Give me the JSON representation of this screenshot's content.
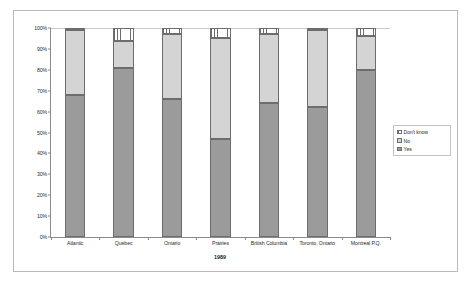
{
  "chart_data": {
    "type": "bar",
    "subtype": "stacked-100-percent",
    "title": "",
    "xlabel": "1989",
    "ylabel": "",
    "ylim": [
      0,
      100
    ],
    "y_ticks": [
      "0%",
      "10%",
      "20%",
      "30%",
      "40%",
      "50%",
      "60%",
      "70%",
      "80%",
      "90%",
      "100%"
    ],
    "y_tick_values": [
      0,
      10,
      20,
      30,
      40,
      50,
      60,
      70,
      80,
      90,
      100
    ],
    "grid": false,
    "legend_position": "right",
    "categories": [
      "Atlantic",
      "Quebec",
      "Ontario",
      "Prairies",
      "British Columbia",
      "Toronto, Ontario",
      "Montreal P.Q."
    ],
    "series": [
      {
        "name": "Yes",
        "values": [
          68,
          81,
          66,
          47,
          64,
          62,
          80
        ],
        "color": "#9b9b9b",
        "fill": "solid"
      },
      {
        "name": "No",
        "values": [
          31,
          13,
          31,
          48,
          33,
          37,
          16
        ],
        "color": "#d4d4d4",
        "fill": "solid"
      },
      {
        "name": "Don't know",
        "values": [
          1,
          6,
          3,
          5,
          3,
          1,
          4
        ],
        "color": "#ffffff",
        "fill": "crosshatch"
      }
    ],
    "legend": [
      "Don't know",
      "No",
      "Yes"
    ]
  },
  "colors": {
    "frame_border": "#b9b9b9",
    "axis": "#8a8a8a",
    "text": "#2b2b2b",
    "segment_border": "#6d6d6d",
    "yes": "#9b9b9b",
    "no": "#d4d4d4",
    "dont_know": "#ffffff"
  }
}
